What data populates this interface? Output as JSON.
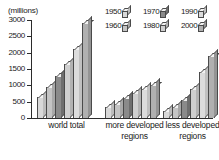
{
  "chart_data": {
    "type": "bar",
    "title": "",
    "subtitle": "",
    "xlabel": "",
    "ylabel": "(millions)",
    "unit_label": "(millions)",
    "ylim": [
      0,
      3000
    ],
    "ytick_values": [
      3000,
      2500,
      2000,
      1500,
      1000,
      500,
      0
    ],
    "ytick_labels": [
      "3000",
      "2500",
      "2000",
      "1500",
      "1000",
      "500",
      "0"
    ],
    "grid": false,
    "legend_position": "top-right",
    "categories": [
      "world total",
      "more developed regions",
      "less developed regions"
    ],
    "series": [
      {
        "name": "1950",
        "values": [
          2536,
          814,
          1722
        ],
        "display_values": [
          650,
          350,
          200
        ],
        "color": "#d8d8d8"
      },
      {
        "name": "1960",
        "values": [
          3032,
          915,
          2117
        ],
        "display_values": [
          950,
          430,
          350
        ],
        "color": "#c4c4c4"
      },
      {
        "name": "1970",
        "values": [
          3699,
          1008,
          2691
        ],
        "display_values": [
          1300,
          600,
          550
        ],
        "color": "#8a8a8a"
      },
      {
        "name": "1980",
        "values": [
          4451,
          1083,
          3368
        ],
        "display_values": [
          1650,
          760,
          900
        ],
        "color": "#cfcfcf"
      },
      {
        "name": "1990",
        "values": [
          5295,
          1148,
          4147
        ],
        "display_values": [
          2100,
          880,
          1400
        ],
        "color": "#dcdcdc"
      },
      {
        "name": "2000",
        "values": [
          6124,
          1188,
          4936
        ],
        "display_values": [
          2900,
          1020,
          1900
        ],
        "color": "#b0b0b0"
      }
    ],
    "series_labels_row1": [
      "1950",
      "1970",
      "1990"
    ],
    "series_labels_row2": [
      "1960",
      "1980",
      "2000"
    ]
  },
  "legend": {
    "rows": [
      [
        {
          "label": "1950",
          "swatch": "light-gray-box-icon",
          "color": "#d8d8d8"
        },
        {
          "label": "1970",
          "swatch": "dark-gray-box-icon",
          "color": "#8a8a8a"
        },
        {
          "label": "1990",
          "swatch": "light-gray-box-icon",
          "color": "#dcdcdc"
        }
      ],
      [
        {
          "label": "1960",
          "swatch": "mid-gray-box-icon",
          "color": "#c4c4c4"
        },
        {
          "label": "1980",
          "swatch": "light-gray-box-icon",
          "color": "#cfcfcf"
        },
        {
          "label": "2000",
          "swatch": "mid-gray-box-icon",
          "color": "#b0b0b0"
        }
      ]
    ]
  },
  "axis": {
    "unit": "(millions)"
  },
  "groups": [
    {
      "label_line1": "world total",
      "label_line2": ""
    },
    {
      "label_line1": "more developed",
      "label_line2": "regions"
    },
    {
      "label_line1": "less developed",
      "label_line2": "regions"
    }
  ]
}
